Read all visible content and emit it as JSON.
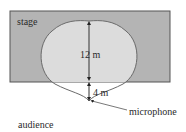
{
  "diagram": {
    "type": "cardioid pickup pattern",
    "labels": {
      "stage": "stage",
      "audience": "audience",
      "microphone": "microphone",
      "front_distance": "12 m",
      "rear_distance": "4 m"
    },
    "colors": {
      "stage_fill": "#b4b4b4",
      "stage_border": "#555555",
      "pattern_fill_on_stage": "#dcdcdc",
      "pattern_stroke": "#6a6a6a",
      "arrow": "#333333",
      "text": "#2a2a2a",
      "background": "#ffffff"
    },
    "geometry": {
      "stage_rect": {
        "x": 10,
        "y": 11,
        "w": 160,
        "h": 71
      },
      "microphone_point": {
        "x": 89,
        "y": 101
      },
      "pattern_top": {
        "x": 89,
        "y": 21
      },
      "stage_edge_y": 81
    }
  }
}
